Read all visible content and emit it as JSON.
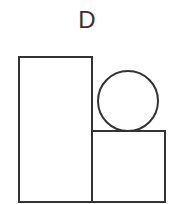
{
  "figure": {
    "label": "D",
    "stroke_color": "#333333",
    "shapes": [
      {
        "type": "rect",
        "name": "tall-rectangle",
        "x": 19,
        "y": 57,
        "width": 73,
        "height": 145
      },
      {
        "type": "rect",
        "name": "square",
        "x": 92,
        "y": 131,
        "width": 73,
        "height": 71
      },
      {
        "type": "circle",
        "name": "circle",
        "cx": 128,
        "cy": 101,
        "r": 30
      }
    ]
  }
}
